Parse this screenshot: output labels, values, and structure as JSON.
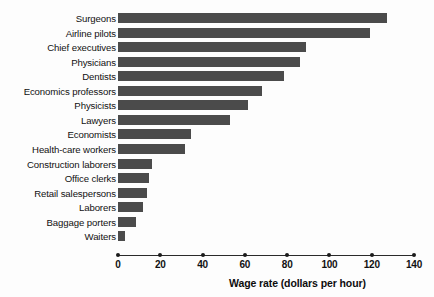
{
  "chart_data": {
    "type": "bar",
    "orientation": "horizontal",
    "title": "",
    "xlabel": "Wage rate (dollars per hour)",
    "ylabel": "",
    "xlim": [
      0,
      140
    ],
    "xticks": [
      0,
      20,
      40,
      60,
      80,
      100,
      120,
      140
    ],
    "grid": false,
    "legend": false,
    "bar_color": "#4b4b4b",
    "categories": [
      "Surgeons",
      "Airline pilots",
      "Chief executives",
      "Physicians",
      "Dentists",
      "Economics professors",
      "Physicists",
      "Lawyers",
      "Economists",
      "Health-care workers",
      "Construction laborers",
      "Office clerks",
      "Retail salespersons",
      "Laborers",
      "Baggage porters",
      "Waiters"
    ],
    "values": [
      127,
      119,
      89,
      86,
      78.5,
      68,
      61.5,
      53,
      34.5,
      31.5,
      16,
      14.7,
      13.5,
      11.8,
      8.4,
      3.3
    ]
  },
  "axis": {
    "x_title": "Wage rate (dollars per hour)",
    "tick_labels": [
      "0",
      "20",
      "40",
      "60",
      "80",
      "100",
      "120",
      "140"
    ]
  }
}
